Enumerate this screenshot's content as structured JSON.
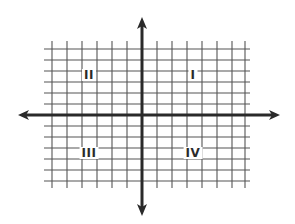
{
  "diagram": {
    "type": "coordinate-plane",
    "colors": {
      "background": "#ffffff",
      "grid": "#555555",
      "axis": "#2a2a2a",
      "label": "#2a2a2a"
    },
    "grid": {
      "x_lines": [
        52,
        67,
        82,
        97,
        112,
        127,
        157,
        172,
        187,
        202,
        217,
        232,
        245
      ],
      "y_lines": [
        49,
        60,
        71,
        82,
        93,
        104,
        126,
        137,
        148,
        159,
        170,
        181
      ],
      "x_extent": [
        44,
        250
      ],
      "y_extent": [
        41,
        188
      ]
    },
    "axes": {
      "origin": [
        142,
        115
      ],
      "x_axis": {
        "from": 18,
        "to": 280
      },
      "y_axis": {
        "from": 17,
        "to": 216
      }
    },
    "quadrants": [
      {
        "id": "quadrant-1",
        "label": "I",
        "x": 193,
        "y": 75
      },
      {
        "id": "quadrant-2",
        "label": "II",
        "x": 89,
        "y": 75
      },
      {
        "id": "quadrant-3",
        "label": "III",
        "x": 89,
        "y": 153
      },
      {
        "id": "quadrant-4",
        "label": "IV",
        "x": 193,
        "y": 153
      }
    ]
  }
}
